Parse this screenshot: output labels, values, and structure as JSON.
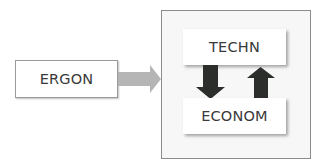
{
  "diagram": {
    "nodes": {
      "ergon": {
        "label": "ERGON"
      },
      "techn": {
        "label": "TECHN"
      },
      "econom": {
        "label": "ECONOM"
      }
    },
    "edges": [
      {
        "from": "ERGON",
        "to": "TECHN/ECONOM group",
        "style": "gray-block-arrow",
        "direction": "right"
      },
      {
        "from": "TECHN",
        "to": "ECONOM",
        "style": "dark-block-arrow",
        "direction": "down"
      },
      {
        "from": "ECONOM",
        "to": "TECHN",
        "style": "dark-block-arrow",
        "direction": "up"
      }
    ],
    "colors": {
      "feed_arrow": "#b5b5b5",
      "cycle_arrows": "#2b2e2b",
      "container_bg": "#f7f7f7",
      "container_border": "#8c8c8c",
      "node_bg": "#ffffff",
      "text": "#3a3a3a"
    }
  }
}
